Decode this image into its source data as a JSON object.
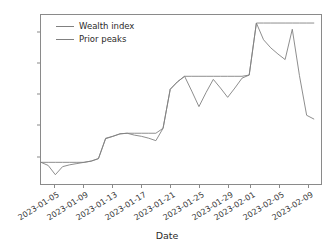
{
  "chart_data": {
    "type": "line",
    "title": "",
    "xlabel": "Date",
    "ylabel": "",
    "grid": false,
    "legend_position": "upper left",
    "ylim": [
      955,
      1228
    ],
    "xlim": [
      "2023-01-03",
      "2023-02-11"
    ],
    "yticks": [
      1000,
      1050,
      1100,
      1150,
      1200
    ],
    "xticks": [
      "2023-01-05",
      "2023-01-09",
      "2023-01-13",
      "2023-01-17",
      "2023-01-21",
      "2023-01-25",
      "2023-01-29",
      "2023-02-01",
      "2023-02-05",
      "2023-02-09"
    ],
    "x": [
      "2023-01-03",
      "2023-01-04",
      "2023-01-05",
      "2023-01-06",
      "2023-01-07",
      "2023-01-08",
      "2023-01-09",
      "2023-01-10",
      "2023-01-11",
      "2023-01-12",
      "2023-01-13",
      "2023-01-14",
      "2023-01-15",
      "2023-01-16",
      "2023-01-17",
      "2023-01-18",
      "2023-01-19",
      "2023-01-20",
      "2023-01-21",
      "2023-01-22",
      "2023-01-23",
      "2023-01-24",
      "2023-01-25",
      "2023-01-26",
      "2023-01-27",
      "2023-01-28",
      "2023-01-29",
      "2023-01-30",
      "2023-01-31",
      "2023-02-01",
      "2023-02-02",
      "2023-02-03",
      "2023-02-04",
      "2023-02-05",
      "2023-02-06",
      "2023-02-07",
      "2023-02-08",
      "2023-02-09",
      "2023-02-10"
    ],
    "series": [
      {
        "name": "Wealth index",
        "color": "#808080",
        "values": [
          990,
          985,
          970,
          983,
          986,
          988,
          990,
          992,
          996,
          1028,
          1032,
          1036,
          1037,
          1034,
          1032,
          1029,
          1025,
          1045,
          1108,
          1120,
          1129,
          1105,
          1080,
          1103,
          1124,
          1110,
          1095,
          1110,
          1126,
          1131,
          1215,
          1188,
          1175,
          1165,
          1156,
          1205,
          1130,
          1066,
          1060
        ]
      },
      {
        "name": "Prior peaks",
        "color": "#808080",
        "values": [
          990,
          990,
          990,
          990,
          990,
          990,
          990,
          992,
          996,
          1029,
          1032,
          1036,
          1037,
          1037,
          1037,
          1037,
          1037,
          1045,
          1108,
          1120,
          1129,
          1129,
          1129,
          1129,
          1129,
          1129,
          1129,
          1129,
          1129,
          1131,
          1215,
          1215,
          1215,
          1215,
          1215,
          1215,
          1215,
          1215,
          1215
        ]
      }
    ]
  },
  "legend": {
    "items": [
      {
        "label": "Wealth index"
      },
      {
        "label": "Prior peaks"
      }
    ]
  },
  "axes": {
    "xlabel": "Date"
  }
}
